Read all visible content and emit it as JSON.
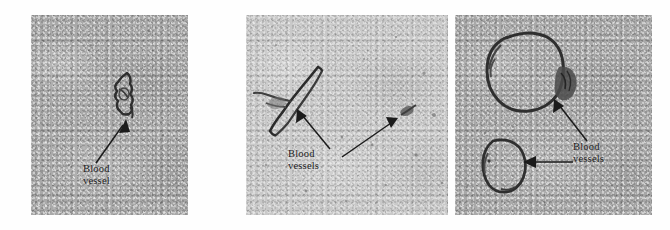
{
  "figure": {
    "name": "blood-vessel-micrographs",
    "background_color": "#ffffff",
    "width": 670,
    "height": 230
  },
  "panels": [
    {
      "id": "panel-1",
      "position": {
        "x": 31,
        "y": 15,
        "width": 157,
        "height": 200
      },
      "background_color": "#a9a9a9",
      "tone": "medium-gray",
      "label": {
        "text": "Blood\nvessel",
        "x": 52,
        "y": 150,
        "color": "#1a1a1a"
      },
      "arrows": [
        {
          "id": "arrow-1",
          "from_x": 65,
          "from_y": 150,
          "to_x": 94,
          "to_y": 106
        }
      ],
      "vessels": [
        {
          "id": "vessel-1",
          "shape": "irregular-small",
          "cx": 98,
          "cy": 82
        }
      ]
    },
    {
      "id": "panel-2",
      "position": {
        "x": 246,
        "y": 15,
        "width": 202,
        "height": 200
      },
      "background_color": "#c9c9c9",
      "tone": "light-gray",
      "label": {
        "text": "Blood\nvessels",
        "x": 42,
        "y": 135,
        "color": "#1a1a1a"
      },
      "arrows": [
        {
          "id": "arrow-1",
          "from_x": 82,
          "from_y": 136,
          "to_x": 50,
          "to_y": 94
        },
        {
          "id": "arrow-2",
          "from_x": 98,
          "from_y": 140,
          "to_x": 153,
          "to_y": 105
        }
      ],
      "vessels": [
        {
          "id": "vessel-1",
          "shape": "elongated-diagonal",
          "cx": 44,
          "cy": 76
        },
        {
          "id": "vessel-2",
          "shape": "small-spot",
          "cx": 160,
          "cy": 100
        }
      ]
    },
    {
      "id": "panel-3",
      "position": {
        "x": 455,
        "y": 15,
        "width": 197,
        "height": 200
      },
      "background_color": "#a9a9a9",
      "tone": "medium-gray",
      "label": {
        "text": "Blood\nvessels",
        "x": 118,
        "y": 128,
        "color": "#1a1a1a"
      },
      "arrows": [
        {
          "id": "arrow-1",
          "from_x": 130,
          "from_y": 128,
          "to_x": 90,
          "to_y": 80
        },
        {
          "id": "arrow-2",
          "from_x": 114,
          "from_y": 150,
          "to_x": 63,
          "to_y": 150
        }
      ],
      "vessels": [
        {
          "id": "vessel-1",
          "shape": "large-oval-ring",
          "cx": 68,
          "cy": 55
        },
        {
          "id": "vessel-2",
          "shape": "small-oval-ring",
          "cx": 48,
          "cy": 152
        }
      ]
    }
  ]
}
